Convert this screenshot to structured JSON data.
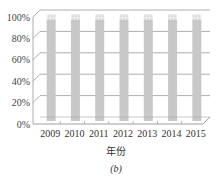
{
  "chart_data": {
    "type": "bar",
    "stacked": true,
    "percent": true,
    "style": "3d",
    "title": "",
    "xlabel": "年份",
    "ylabel": "",
    "caption": "(b)",
    "categories": [
      "2009",
      "2010",
      "2011",
      "2012",
      "2013",
      "2014",
      "2015"
    ],
    "series": [
      {
        "name": "main",
        "values": [
          95,
          95,
          95,
          95,
          95,
          95,
          95
        ],
        "color": "#c8c8c8"
      },
      {
        "name": "top",
        "values": [
          5,
          5,
          5,
          5,
          5,
          5,
          5
        ],
        "color": "#e8e8e8",
        "pattern": "dotted-hatch"
      }
    ],
    "yticks": [
      "0%",
      "20%",
      "40%",
      "60%",
      "80%",
      "100%"
    ],
    "ylim": [
      0,
      100
    ],
    "grid": true,
    "legend": null
  }
}
